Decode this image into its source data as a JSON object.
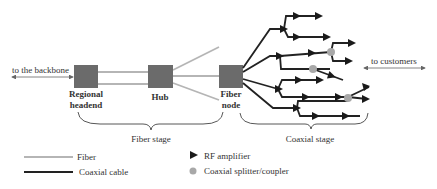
{
  "diagram": {
    "labels": {
      "backbone": "to the backbone",
      "customers": "to customers",
      "regional_headend_line1": "Regional",
      "regional_headend_line2": "headend",
      "hub": "Hub",
      "fiber_node_line1": "Fiber",
      "fiber_node_line2": "node",
      "fiber_stage": "Fiber stage",
      "coaxial_stage": "Coaxial stage"
    },
    "nodes": [
      {
        "id": "regional-headend",
        "label": "Regional headend"
      },
      {
        "id": "hub",
        "label": "Hub"
      },
      {
        "id": "fiber-node",
        "label": "Fiber node"
      }
    ],
    "legend": [
      {
        "symbol": "fiber-line",
        "label": "Fiber"
      },
      {
        "symbol": "coax-line",
        "label": "Coaxial cable"
      },
      {
        "symbol": "rf-amplifier-icon",
        "label": "RF amplifier"
      },
      {
        "symbol": "splitter-icon",
        "label": "Coaxial splitter/coupler"
      }
    ],
    "colors": {
      "fiber": "#b5b5b5",
      "coax": "#222222",
      "node_box": "#6b6b6b",
      "splitter": "#a8a8a8"
    }
  }
}
